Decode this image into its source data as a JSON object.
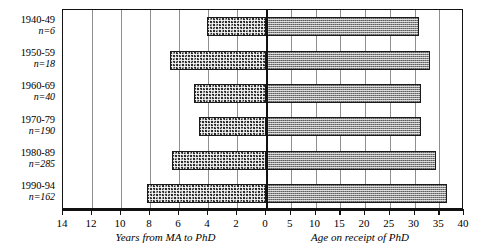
{
  "chart_data": {
    "type": "bar",
    "orientation": "horizontal",
    "style": "back-to-back bidirectional bar chart",
    "title": "",
    "categories": [
      "1940-49",
      "1950-59",
      "1960-69",
      "1970-79",
      "1980-89",
      "1990-94"
    ],
    "group_counts": [
      "n=6",
      "n=18",
      "n=40",
      "n=190",
      "n=285",
      "n=162"
    ],
    "group_n_values": [
      6,
      18,
      40,
      190,
      285,
      162
    ],
    "series": [
      {
        "name": "Years from MA to PhD",
        "side": "left",
        "axis_direction": "reversed",
        "xlabel": "Years from MA to PhD",
        "xlim": [
          14,
          0
        ],
        "ticks": [
          14,
          12,
          10,
          8,
          6,
          4,
          2,
          0
        ],
        "values": [
          4.1,
          6.6,
          5.0,
          4.6,
          6.5,
          8.2
        ]
      },
      {
        "name": "Age on receipt of PhD",
        "side": "right",
        "axis_direction": "normal",
        "xlabel": "Age on receipt of PhD",
        "xlim": [
          0,
          40
        ],
        "ticks": [
          0,
          5,
          10,
          15,
          20,
          25,
          30,
          35,
          40
        ],
        "values": [
          31.0,
          33.2,
          31.4,
          31.3,
          34.3,
          36.6
        ]
      }
    ],
    "grid": true,
    "grid_axis": "x",
    "legend": "none",
    "ylabel": ""
  },
  "axis": {
    "left_title": "Years from MA to PhD",
    "right_title": "Age on receipt of PhD",
    "left_ticks": [
      "14",
      "12",
      "10",
      "8",
      "6",
      "4",
      "2",
      "0"
    ],
    "right_ticks": [
      "5",
      "10",
      "15",
      "20",
      "25",
      "30",
      "35",
      "40"
    ]
  },
  "colors": {
    "bar_left": "#2b2b2b",
    "bar_right": "#8d8d8d",
    "frame": "#111111",
    "grid": "#8f8f8f",
    "background": "#ffffff",
    "text": "#000000"
  }
}
